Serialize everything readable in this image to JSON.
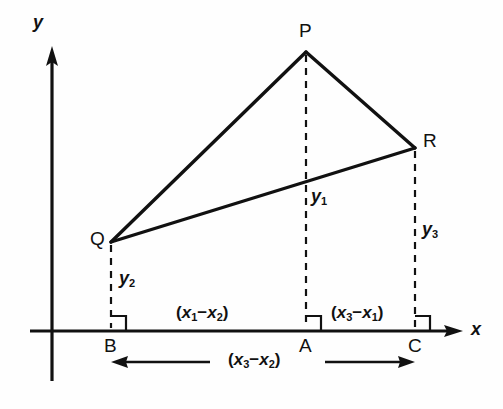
{
  "figure": {
    "background_color": "#fefefe",
    "line_color": "#111111"
  },
  "axes": {
    "x_label": "x",
    "y_label": "y",
    "x_axis_name": "x-axis",
    "y_axis_name": "y-axis",
    "origin_px": [
      52,
      331
    ],
    "x_arrow_tip_px": [
      463,
      331
    ],
    "y_arrow_tip_px": [
      52,
      46
    ]
  },
  "vertices": [
    {
      "name": "P",
      "label": "P",
      "px": [
        306,
        52
      ]
    },
    {
      "name": "Q",
      "label": "Q",
      "px": [
        111,
        242
      ]
    },
    {
      "name": "R",
      "label": "R",
      "px": [
        415,
        148
      ]
    }
  ],
  "feet": [
    {
      "name": "A",
      "label": "A",
      "px": [
        306,
        331
      ],
      "above": "P"
    },
    {
      "name": "B",
      "label": "B",
      "px": [
        111,
        331
      ],
      "above": "Q"
    },
    {
      "name": "C",
      "label": "C",
      "px": [
        415,
        331
      ],
      "above": "R"
    }
  ],
  "heights": [
    {
      "name": "y1",
      "label": "y",
      "subscript": "1",
      "from": "P",
      "to": "A"
    },
    {
      "name": "y2",
      "label": "y",
      "subscript": "2",
      "from": "Q",
      "to": "B"
    },
    {
      "name": "y3",
      "label": "y",
      "subscript": "3",
      "from": "R",
      "to": "C"
    }
  ],
  "span_labels": [
    {
      "name": "x1-minus-x2",
      "open": "(",
      "first_var": "x",
      "first_sub": "1",
      "operator": "−",
      "second_var": "x",
      "second_sub": "2",
      "close": ")",
      "between": [
        "B",
        "A"
      ]
    },
    {
      "name": "x3-minus-x1",
      "open": "(",
      "first_var": "x",
      "first_sub": "3",
      "operator": "−",
      "second_var": "x",
      "second_sub": "1",
      "close": ")",
      "between": [
        "A",
        "C"
      ]
    },
    {
      "name": "x3-minus-x2",
      "open": "(",
      "first_var": "x",
      "first_sub": "3",
      "operator": "−",
      "second_var": "x",
      "second_sub": "2",
      "close": ")",
      "between": [
        "B",
        "C"
      ]
    }
  ],
  "annotations": {
    "right_angle_marks": [
      "B",
      "A",
      "C"
    ],
    "dimension_arrows": [
      "left-arrow-to-B",
      "right-arrow-to-C"
    ]
  }
}
